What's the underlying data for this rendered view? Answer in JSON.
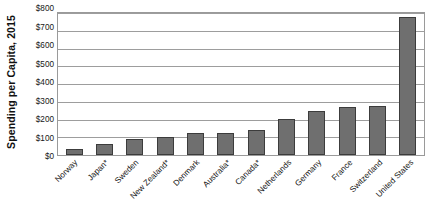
{
  "chart_data": {
    "type": "bar",
    "title": "",
    "xlabel": "",
    "ylabel": "Spending per Capita, 2015",
    "ylim": [
      0,
      800
    ],
    "grid": true,
    "legend": "none",
    "bar_color": "#6f6f6f",
    "bar_edge_color": "#3c3c3c",
    "gridline_color": "#9d9d9d",
    "y_ticks": [
      {
        "value": 800,
        "label": "$800"
      },
      {
        "value": 700,
        "label": "$700"
      },
      {
        "value": 600,
        "label": "$600"
      },
      {
        "value": 500,
        "label": "$500"
      },
      {
        "value": 400,
        "label": "$400"
      },
      {
        "value": 300,
        "label": "$300"
      },
      {
        "value": 200,
        "label": "$200"
      },
      {
        "value": 100,
        "label": "$100"
      },
      {
        "value": 0,
        "label": "$0"
      }
    ],
    "categories": [
      "Norway",
      "Japan*",
      "Sweden",
      "New Zealand*",
      "Denmark",
      "Australia*",
      "Canada*",
      "Netherlands",
      "Germany",
      "France",
      "Switzerland",
      "United States"
    ],
    "values": [
      35,
      64,
      93,
      100,
      125,
      125,
      139,
      204,
      250,
      272,
      276,
      780
    ]
  }
}
